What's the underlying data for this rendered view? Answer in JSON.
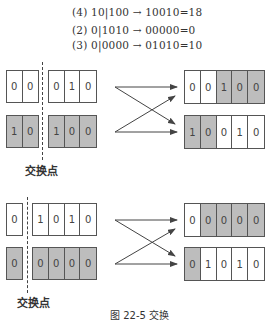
{
  "equations": [
    {
      "text": "(4) 10|100 → 10010=18"
    },
    {
      "text": "(2) 0|1010 → 00000=0"
    },
    {
      "text": "(3) 0|0000 → 01010=10"
    }
  ],
  "diagram1": {
    "parent_top_left": [
      "0",
      "0"
    ],
    "parent_top_right": [
      "0",
      "1",
      "0"
    ],
    "parent_bottom_left": [
      "1",
      "0"
    ],
    "parent_bottom_right": [
      "1",
      "0",
      "0"
    ],
    "child_top": [
      "0",
      "0",
      "1",
      "0",
      "0"
    ],
    "child_bottom": [
      "1",
      "0",
      "0",
      "1",
      "0"
    ],
    "crossover_label": "交换点"
  },
  "diagram2": {
    "parent_top_left": [
      "0"
    ],
    "parent_top_right": [
      "1",
      "0",
      "1",
      "0"
    ],
    "parent_bottom_left": [
      "0"
    ],
    "parent_bottom_right": [
      "0",
      "0",
      "0",
      "0"
    ],
    "child_top": [
      "0",
      "0",
      "0",
      "0",
      "0"
    ],
    "child_bottom": [
      "0",
      "1",
      "0",
      "1",
      "0"
    ],
    "crossover_label": "交换点"
  },
  "caption": "图 22-5  交换",
  "colors": {
    "shaded": "#bdbdbd",
    "line": "#555555"
  }
}
